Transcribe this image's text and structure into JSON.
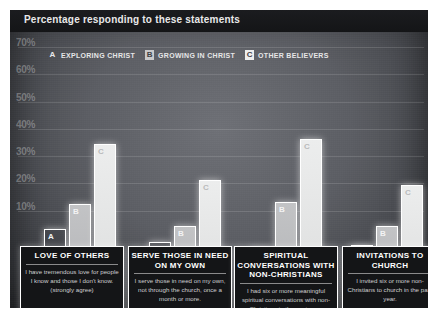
{
  "title": "Percentage responding to these statements",
  "legend": [
    {
      "key": "A",
      "label": "EXPLORING CHRIST"
    },
    {
      "key": "B",
      "label": "GROWING IN CHRIST"
    },
    {
      "key": "C",
      "label": "OTHER BELIEVERS"
    }
  ],
  "yticks": [
    "70%",
    "60%",
    "50%",
    "40%",
    "30%",
    "20%",
    "10%"
  ],
  "captions": [
    {
      "title": "LOVE OF OTHERS",
      "sub": "I have tremendous love for people I know and those I don't know. (strongly agree)"
    },
    {
      "title": "SERVE THOSE IN NEED ON MY OWN",
      "sub": "I serve those in need on my own, not through the church, once a month or more."
    },
    {
      "title": "SPIRITUAL CONVERSATIONS WITH NON-CHRISTIANS",
      "sub": "I had six or more meaningful spiritual conversations with non-Christians in the past year."
    },
    {
      "title": "INVITATIONS TO CHURCH",
      "sub": "I invited six or more non-Christians to church in the past year."
    }
  ],
  "colors": {
    "panel_dark": "#141517",
    "bar_outline": "#ffffff",
    "bar_a_fill": "#3a3c41",
    "bar_b_fill": "#c2c3c5",
    "bar_c_fill": "#ecedee",
    "grid": "#8c8e93"
  },
  "chart_data": {
    "type": "bar",
    "title": "Percentage responding to these statements",
    "xlabel": "",
    "ylabel": "",
    "ylim": [
      0,
      72
    ],
    "grid": true,
    "legend_position": "top-left",
    "ytick_labels": [
      "10%",
      "20%",
      "30%",
      "40%",
      "50%",
      "60%",
      "70%"
    ],
    "ytick_values": [
      10,
      20,
      30,
      40,
      50,
      60,
      70
    ],
    "categories": [
      "LOVE OF OTHERS",
      "SERVE THOSE IN NEED ON MY OWN",
      "SPIRITUAL CONVERSATIONS WITH NON-CHRISTIANS",
      "INVITATIONS TO CHURCH"
    ],
    "series": [
      {
        "name": "EXPLORING CHRIST",
        "key": "A",
        "values": [
          29,
          24,
          22,
          23
        ]
      },
      {
        "name": "GROWING IN CHRIST",
        "key": "B",
        "values": [
          38,
          30,
          39,
          30
        ]
      },
      {
        "name": "OTHER BELIEVERS",
        "key": "C",
        "values": [
          60,
          47,
          62,
          45
        ]
      }
    ]
  }
}
